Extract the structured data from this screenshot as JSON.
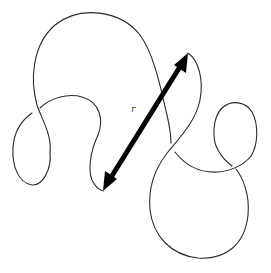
{
  "diagram": {
    "title": "",
    "label": "r",
    "colors": {
      "curve": "#2a2a2a",
      "arrow": "#000000",
      "label": "#444444",
      "background": "#ffffff"
    },
    "arrow": {
      "from": [
        103,
        190
      ],
      "to": [
        188,
        53
      ],
      "double_headed": true
    },
    "label_position": [
      131,
      112
    ]
  }
}
